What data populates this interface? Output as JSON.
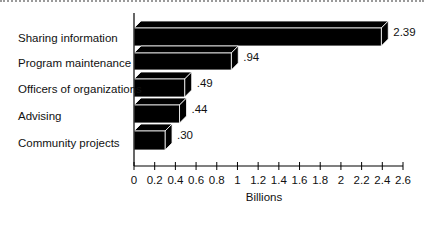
{
  "chart_data": {
    "type": "bar",
    "orientation": "horizontal",
    "style": "3d",
    "title": "",
    "xlabel": "Billions",
    "ylabel": "",
    "categories": [
      "Sharing information",
      "Program maintenance",
      "Officers of organizations",
      "Advising",
      "Community projects"
    ],
    "values": [
      2.39,
      0.94,
      0.49,
      0.44,
      0.3
    ],
    "value_labels": [
      "2.39",
      ".94",
      ".49",
      ".44",
      ".30"
    ],
    "xlim": [
      0,
      2.6
    ],
    "xticks": [
      "0",
      "0.2",
      "0.4",
      "0.6",
      "0.8",
      "1",
      "1.2",
      "1.4",
      "1.6",
      "1.8",
      "2",
      "2.2",
      "2.4",
      "2.6"
    ],
    "grid": false,
    "legend": null,
    "bar_color": "#000000"
  }
}
